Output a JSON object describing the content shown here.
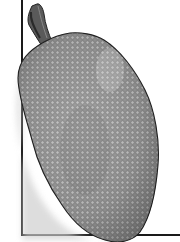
{
  "image": {
    "subject": "jackfruit illustration",
    "style": "grayscale engraving",
    "colors": {
      "background": "#ffffff",
      "frame": "#1a1a1a",
      "fruit_light": "#b8b8b8",
      "fruit_mid": "#8f8f8f",
      "fruit_dark": "#5a5a5a",
      "stem": "#4a4a4a",
      "outline": "#222222"
    }
  }
}
